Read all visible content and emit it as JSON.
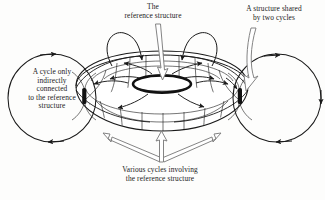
{
  "diagram": {
    "background_color": "#fdfdfc",
    "ink_color": "#1a1a1a",
    "labels": {
      "reference_structure": "The\nreference structure",
      "shared_structure": "A structure shared\nby two cycles",
      "indirect_cycle": "A cycle only\nindirectly\nconnected\nto the reference\nstructure",
      "various_cycles": "Various cycles involving\nthe reference structure"
    },
    "elements": {
      "torus": "torus-shape",
      "inner_hole": "inner-hole-ellipse",
      "left_cycle": "left-cycle-circle",
      "right_cycle": "right-cycle-circle",
      "left_node": "left-junction-node",
      "right_node": "right-junction-node",
      "top_left_loop": "top-left-loop-arc",
      "top_right_loop": "top-right-loop-arc",
      "pointer_reference": "reference-pointer-arrow",
      "pointer_shared": "shared-pointer-arrow",
      "pointer_various": "various-cycles-pointer-arrow"
    }
  }
}
